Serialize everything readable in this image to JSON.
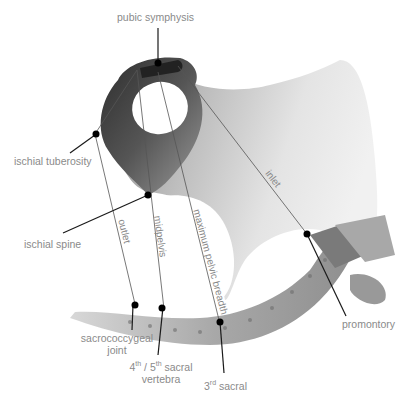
{
  "diagram": {
    "labels": {
      "pubic_symphysis": "pubic symphysis",
      "ischial_tuberosity": "ischial tuberosity",
      "ischial_spine": "ischial spine",
      "sacrococcygeal_line1": "sacrococcygeal",
      "sacrococcygeal_line2": "joint",
      "sacral45_a": "4",
      "sacral45_sup1": "th",
      "sacral45_b": " / 5",
      "sacral45_sup2": "th",
      "sacral45_c": " sacral",
      "sacral45_line2": "vertebra",
      "sacral3_a": "3",
      "sacral3_sup": "rd",
      "sacral3_b": " sacral",
      "promontory": "promontory"
    },
    "plane_labels": {
      "outlet": "outlet",
      "midpelvis": "midpelvis",
      "maximum_pelvic_breadth": "maximum pelvic breadth",
      "inlet": "inlet"
    },
    "colors": {
      "bone_dark": "#3a3a3a",
      "bone_mid": "#8a8a8a",
      "bone_light": "#e6e6e6",
      "label_text": "#8a8a8a",
      "leader_line": "#1a1a1a",
      "plane_line": "#555555"
    }
  }
}
